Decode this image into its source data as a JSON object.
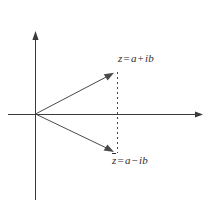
{
  "figure": {
    "background_color": "#ffffff",
    "line_color": "#3a3a3a",
    "text_color": "#2e2e2e",
    "width": 210,
    "height": 204
  },
  "axes": {
    "origin": {
      "x": 35,
      "y": 114
    },
    "horizontal": {
      "name": "real-axis",
      "x_start": 8,
      "x_end": 203,
      "y": 114,
      "arrow_at": "right"
    },
    "vertical": {
      "name": "imaginary-axis",
      "y_start": 32,
      "y_end": 200,
      "x": 35,
      "arrow_at": "top"
    }
  },
  "vectors": [
    {
      "name": "vector-z",
      "from": {
        "x": 35,
        "y": 114
      },
      "to": {
        "x": 113,
        "y": 73
      },
      "arrow": true
    },
    {
      "name": "vector-z-conjugate",
      "from": {
        "x": 35,
        "y": 114
      },
      "to": {
        "x": 113,
        "y": 152
      },
      "arrow": true
    }
  ],
  "dashed_line": {
    "name": "dashed-vertical-connector",
    "x": 117,
    "y_start": 72,
    "y_end": 153,
    "dash": "2 3"
  },
  "labels": {
    "z": {
      "full": "z = a + ib",
      "variable": "z",
      "equals": "=",
      "real_part": "a",
      "operator": "+",
      "imaginary_part": "ib"
    },
    "z_conjugate": {
      "full": "z̄ = a − ib",
      "variable": "z",
      "equals": "=",
      "real_part": "a",
      "operator": "−",
      "imaginary_part": "ib"
    }
  }
}
